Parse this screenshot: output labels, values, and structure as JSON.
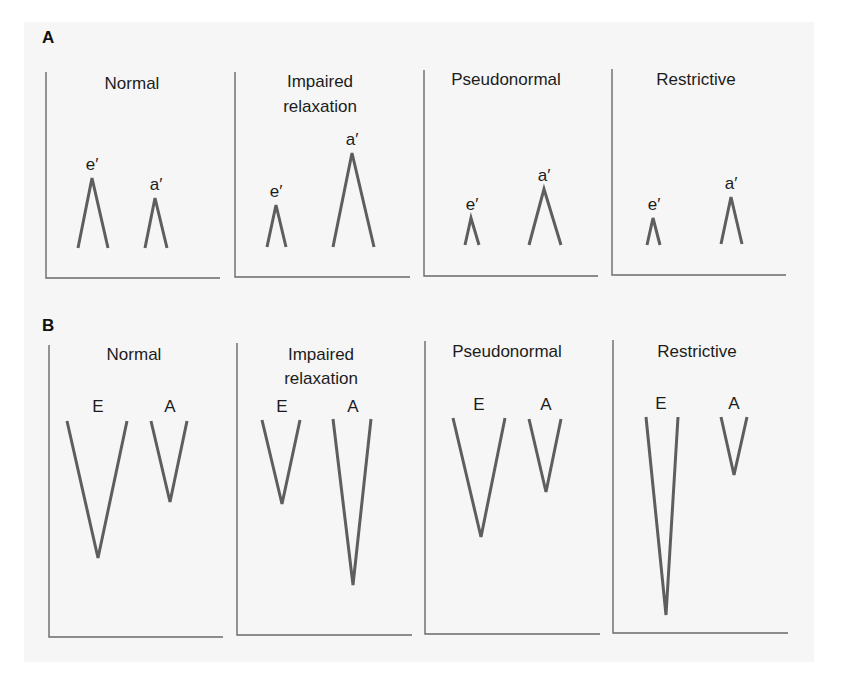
{
  "figure": {
    "sections": [
      {
        "id": "A",
        "label": "A",
        "label_pos": [
          42,
          43
        ],
        "direction": "up",
        "panels": [
          {
            "title_lines": [
              "Normal"
            ],
            "title_x": 132,
            "title_y": [
              89
            ],
            "axis": {
              "x": 46,
              "top": 72,
              "bottom": 278,
              "right": 220
            },
            "waves": [
              {
                "label": "e′",
                "left": [
                  78,
                  248
                ],
                "tip": [
                  92,
                  178
                ],
                "right": [
                  108,
                  248
                ],
                "label_pos": [
                  92,
                  170
                ]
              },
              {
                "label": "a′",
                "left": [
                  145,
                  248
                ],
                "tip": [
                  155,
                  198
                ],
                "right": [
                  167,
                  248
                ],
                "label_pos": [
                  156,
                  190
                ]
              }
            ]
          },
          {
            "title_lines": [
              "Impaired",
              "relaxation"
            ],
            "title_x": 320,
            "title_y": [
              87,
              112
            ],
            "axis": {
              "x": 235,
              "top": 72,
              "bottom": 277,
              "right": 410
            },
            "waves": [
              {
                "label": "e′",
                "left": [
                  267,
                  247
                ],
                "tip": [
                  276,
                  205
                ],
                "right": [
                  286,
                  247
                ],
                "label_pos": [
                  276,
                  197
                ]
              },
              {
                "label": "a′",
                "left": [
                  333,
                  247
                ],
                "tip": [
                  352,
                  153
                ],
                "right": [
                  374,
                  247
                ],
                "label_pos": [
                  352,
                  145
                ]
              }
            ]
          },
          {
            "title_lines": [
              "Pseudonormal"
            ],
            "title_x": 506,
            "title_y": [
              85
            ],
            "axis": {
              "x": 424,
              "top": 70,
              "bottom": 276,
              "right": 598
            },
            "waves": [
              {
                "label": "e′",
                "left": [
                  465,
                  245
                ],
                "tip": [
                  471,
                  218
                ],
                "right": [
                  479,
                  245
                ],
                "label_pos": [
                  472,
                  210
                ]
              },
              {
                "label": "a′",
                "left": [
                  529,
                  245
                ],
                "tip": [
                  544,
                  189
                ],
                "right": [
                  561,
                  245
                ],
                "label_pos": [
                  544,
                  181
                ]
              }
            ]
          },
          {
            "title_lines": [
              "Restrictive"
            ],
            "title_x": 696,
            "title_y": [
              85
            ],
            "axis": {
              "x": 612,
              "top": 69,
              "bottom": 275,
              "right": 786
            },
            "waves": [
              {
                "label": "e′",
                "left": [
                  647,
                  245
                ],
                "tip": [
                  653,
                  218
                ],
                "right": [
                  660,
                  245
                ],
                "label_pos": [
                  654,
                  210
                ]
              },
              {
                "label": "a′",
                "left": [
                  721,
                  244
                ],
                "tip": [
                  731,
                  197
                ],
                "right": [
                  742,
                  244
                ],
                "label_pos": [
                  731,
                  189
                ]
              }
            ]
          }
        ]
      },
      {
        "id": "B",
        "label": "B",
        "label_pos": [
          42,
          331
        ],
        "direction": "down",
        "panels": [
          {
            "title_lines": [
              "Normal"
            ],
            "title_x": 134,
            "title_y": [
              360
            ],
            "axis": {
              "x": 49,
              "top": 345,
              "bottom": 637,
              "right": 223
            },
            "waves": [
              {
                "label": "E",
                "left": [
                  67,
                  421
                ],
                "tip": [
                  98,
                  558
                ],
                "right": [
                  127,
                  421
                ],
                "label_pos": [
                  98,
                  412
                ]
              },
              {
                "label": "A",
                "left": [
                  151,
                  421
                ],
                "tip": [
                  170,
                  502
                ],
                "right": [
                  187,
                  421
                ],
                "label_pos": [
                  170,
                  412
                ]
              }
            ]
          },
          {
            "title_lines": [
              "Impaired",
              "relaxation"
            ],
            "title_x": 321,
            "title_y": [
              360,
              384
            ],
            "axis": {
              "x": 237,
              "top": 343,
              "bottom": 635,
              "right": 412
            },
            "waves": [
              {
                "label": "E",
                "left": [
                  262,
                  420
                ],
                "tip": [
                  282,
                  504
                ],
                "right": [
                  300,
                  420
                ],
                "label_pos": [
                  282,
                  412
                ]
              },
              {
                "label": "A",
                "left": [
                  333,
                  419
                ],
                "tip": [
                  353,
                  585
                ],
                "right": [
                  371,
                  419
                ],
                "label_pos": [
                  353,
                  412
                ]
              }
            ]
          },
          {
            "title_lines": [
              "Pseudonormal"
            ],
            "title_x": 507,
            "title_y": [
              357
            ],
            "axis": {
              "x": 425,
              "top": 341,
              "bottom": 634,
              "right": 600
            },
            "waves": [
              {
                "label": "E",
                "left": [
                  453,
                  418
                ],
                "tip": [
                  481,
                  537
                ],
                "right": [
                  505,
                  418
                ],
                "label_pos": [
                  479,
                  410
                ]
              },
              {
                "label": "A",
                "left": [
                  529,
                  419
                ],
                "tip": [
                  546,
                  492
                ],
                "right": [
                  561,
                  419
                ],
                "label_pos": [
                  546,
                  410
                ]
              }
            ]
          },
          {
            "title_lines": [
              "Restrictive"
            ],
            "title_x": 697,
            "title_y": [
              357
            ],
            "axis": {
              "x": 613,
              "top": 340,
              "bottom": 633,
              "right": 788
            },
            "waves": [
              {
                "label": "E",
                "left": [
                  646,
                  417
                ],
                "tip": [
                  666,
                  615
                ],
                "right": [
                  678,
                  417
                ],
                "label_pos": [
                  661,
                  409
                ]
              },
              {
                "label": "A",
                "left": [
                  721,
                  417
                ],
                "tip": [
                  734,
                  475
                ],
                "right": [
                  747,
                  417
                ],
                "label_pos": [
                  734,
                  409
                ]
              }
            ]
          }
        ]
      }
    ],
    "colors": {
      "sheet": "#f6f6f6",
      "axis": "#6a6a6a",
      "wave": "#5e5e5e",
      "text": "#1c1c1c"
    }
  }
}
